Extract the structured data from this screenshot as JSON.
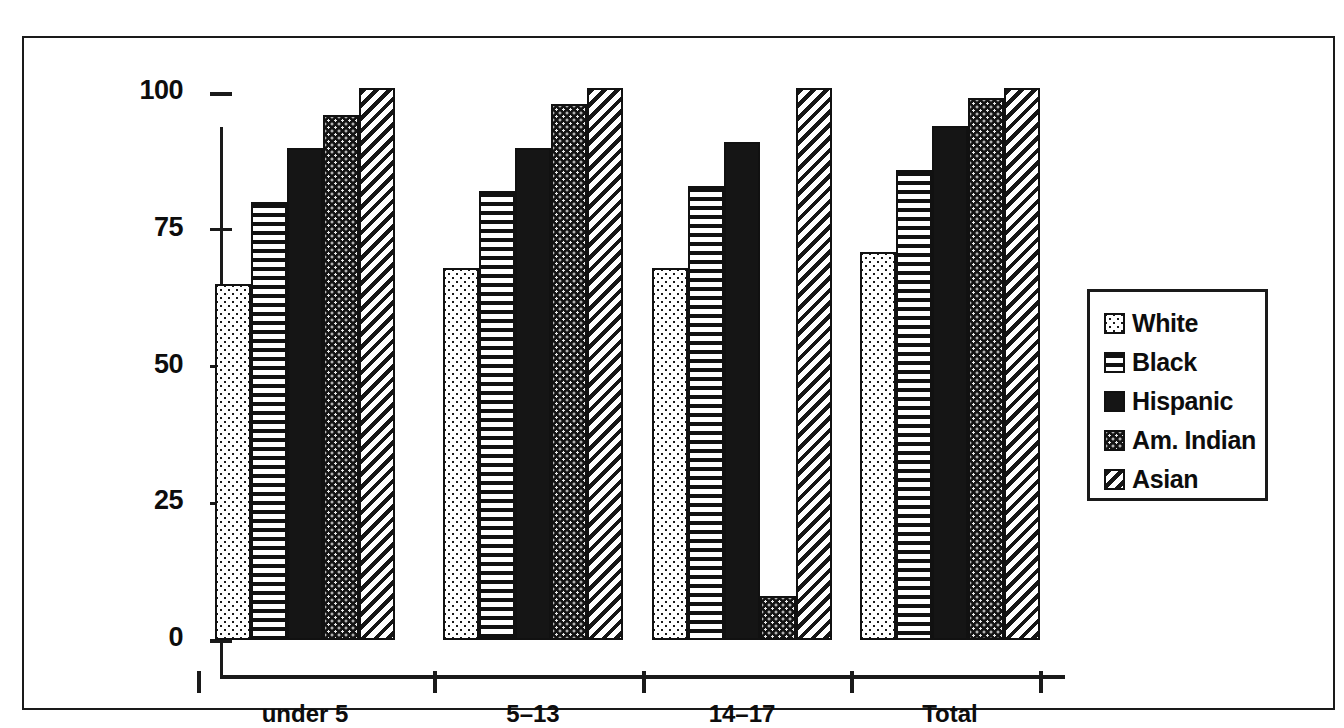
{
  "chart_data": {
    "type": "bar",
    "title": "",
    "xlabel": "",
    "ylabel": "",
    "categories": [
      "under 5",
      "5–13",
      "14–17",
      "Total"
    ],
    "ylim": [
      0,
      100
    ],
    "yticks": [
      0,
      25,
      50,
      75,
      100
    ],
    "ytick_labels": [
      "0",
      "25",
      "50",
      "75",
      "100"
    ],
    "grid": false,
    "legend_position": "right",
    "series": [
      {
        "name": "White",
        "pattern": "light-dots",
        "values": [
          65,
          68,
          68,
          71
        ]
      },
      {
        "name": "Black",
        "pattern": "horizontal-lines",
        "values": [
          80,
          82,
          83,
          86
        ]
      },
      {
        "name": "Hispanic",
        "pattern": "solid-black",
        "values": [
          90,
          90,
          91,
          94
        ]
      },
      {
        "name": "Am. Indian",
        "pattern": "dense-dots",
        "values": [
          96,
          98,
          8,
          99
        ]
      },
      {
        "name": "Asian",
        "pattern": "diagonal-hatch",
        "values": [
          101,
          101,
          101,
          101
        ]
      }
    ]
  },
  "legend": {
    "items": [
      {
        "label": "White"
      },
      {
        "label": "Black"
      },
      {
        "label": "Hispanic"
      },
      {
        "label": "Am. Indian"
      },
      {
        "label": "Asian"
      }
    ]
  },
  "axes": {
    "y_labels": [
      "100",
      "75",
      "50",
      "25",
      "0"
    ],
    "x_labels": [
      "under 5",
      "5–13",
      "14–17",
      "Total"
    ]
  }
}
